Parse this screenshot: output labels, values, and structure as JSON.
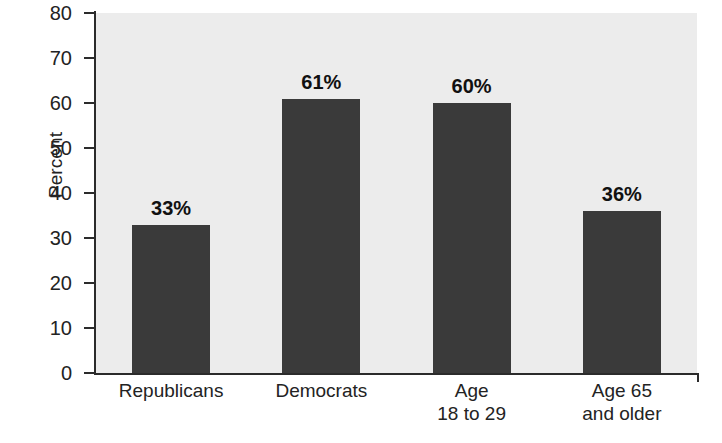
{
  "chart_data": {
    "type": "bar",
    "title": "",
    "subtitle": "",
    "xlabel": "",
    "ylabel": "Percent",
    "ylim": [
      0,
      80
    ],
    "ytick_step": 10,
    "grid": false,
    "legend": "none",
    "categories": [
      "Republicans",
      "Democrats",
      "Age 18 to 29",
      "Age 65 and older"
    ],
    "category_lines": [
      [
        "Republicans"
      ],
      [
        "Democrats"
      ],
      [
        "Age",
        "18 to 29"
      ],
      [
        "Age 65",
        "and older"
      ]
    ],
    "values": [
      33,
      61,
      60,
      36
    ],
    "data_labels": [
      "33%",
      "61%",
      "60%",
      "36%"
    ],
    "ytick_labels": [
      "80",
      "70",
      "60",
      "50",
      "40",
      "30",
      "20",
      "10",
      "0"
    ],
    "ytick_values": [
      80,
      70,
      60,
      50,
      40,
      30,
      20,
      10,
      0
    ]
  },
  "style": {
    "bar_color": "#3a3a3a",
    "plot_background": "#ececec",
    "page_background": "#ffffff",
    "axis_color": "#2b2b2b",
    "text_color": "#232323"
  }
}
